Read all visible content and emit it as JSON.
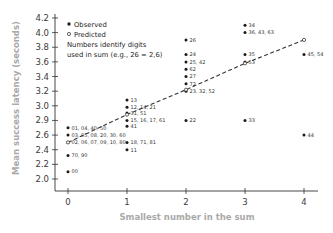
{
  "chart_data": {
    "type": "scatter",
    "title": "",
    "xlabel": "Smallest number in the sum",
    "ylabel": "Mean success latency (seconds)",
    "xlim": [
      -0.2,
      4.25
    ],
    "ylim": [
      1.85,
      4.25
    ],
    "x_ticks": [
      0,
      1,
      2,
      3,
      4
    ],
    "y_ticks": [
      {
        "value": 4.2,
        "label": "4.2"
      },
      {
        "value": 4.0,
        "label": "4.0"
      },
      {
        "value": 3.8,
        "label": "3.8"
      },
      {
        "value": 3.6,
        "label": "3.6"
      },
      {
        "value": 3.4,
        "label": "3.4"
      },
      {
        "value": 3.2,
        "label": "3.2"
      },
      {
        "value": 3.0,
        "label": "3.0"
      },
      {
        "value": 2.8,
        "label": "2.9"
      },
      {
        "value": 2.6,
        "label": "2.6"
      },
      {
        "value": 2.4,
        "label": "2.4"
      },
      {
        "value": 2.2,
        "label": "2.2"
      },
      {
        "value": 2.0,
        "label": "2.0"
      }
    ],
    "grid": false,
    "legend": {
      "position": "top-left",
      "entries": [
        "Observed",
        "Predicted"
      ],
      "note_line1": "Numbers identify digits",
      "note_line2": "used in sum (e.g., 26 = 2,6)"
    },
    "series": [
      {
        "name": "Observed",
        "marker": "filled-circle",
        "points": [
          {
            "x": 0,
            "y": 2.7,
            "label": "01, 04, 40, 50"
          },
          {
            "x": 0,
            "y": 2.6,
            "label": "03, 05, 08, 20, 30, 60"
          },
          {
            "x": 0,
            "y": 2.5,
            "label": "02, 06, 07, 09, 10, 80"
          },
          {
            "x": 0,
            "y": 2.32,
            "label": "70, 90"
          },
          {
            "x": 0,
            "y": 2.1,
            "label": "00"
          },
          {
            "x": 1,
            "y": 3.08,
            "label": "13"
          },
          {
            "x": 1,
            "y": 2.98,
            "label": "12, 14, 21"
          },
          {
            "x": 1,
            "y": 2.9,
            "label": "31, 51"
          },
          {
            "x": 1,
            "y": 2.8,
            "label": "15, 16, 17, 61"
          },
          {
            "x": 1,
            "y": 2.72,
            "label": "41"
          },
          {
            "x": 1,
            "y": 2.5,
            "label": "18, 71, 81"
          },
          {
            "x": 1,
            "y": 2.4,
            "label": "11"
          },
          {
            "x": 2,
            "y": 3.9,
            "label": "26"
          },
          {
            "x": 2,
            "y": 3.7,
            "label": "24"
          },
          {
            "x": 2,
            "y": 3.6,
            "label": "25, 42"
          },
          {
            "x": 2,
            "y": 3.5,
            "label": "62"
          },
          {
            "x": 2,
            "y": 3.4,
            "label": "27"
          },
          {
            "x": 2,
            "y": 3.3,
            "label": "72"
          },
          {
            "x": 2,
            "y": 3.2,
            "label": "23, 32, 52"
          },
          {
            "x": 2,
            "y": 2.8,
            "label": "22"
          },
          {
            "x": 3,
            "y": 4.1,
            "label": "34"
          },
          {
            "x": 3,
            "y": 4.0,
            "label": "36, 43, 63"
          },
          {
            "x": 3,
            "y": 3.7,
            "label": "35"
          },
          {
            "x": 3,
            "y": 3.6,
            "label": "53"
          },
          {
            "x": 3,
            "y": 2.8,
            "label": "33"
          },
          {
            "x": 4,
            "y": 3.7,
            "label": "45, 54"
          },
          {
            "x": 4,
            "y": 2.6,
            "label": "44"
          }
        ]
      },
      {
        "name": "Predicted",
        "marker": "open-circle",
        "line": "dashed",
        "points": [
          {
            "x": 0,
            "y": 2.5
          },
          {
            "x": 1,
            "y": 2.88
          },
          {
            "x": 2,
            "y": 3.22
          },
          {
            "x": 3,
            "y": 3.58
          },
          {
            "x": 4,
            "y": 3.9
          }
        ]
      }
    ]
  }
}
